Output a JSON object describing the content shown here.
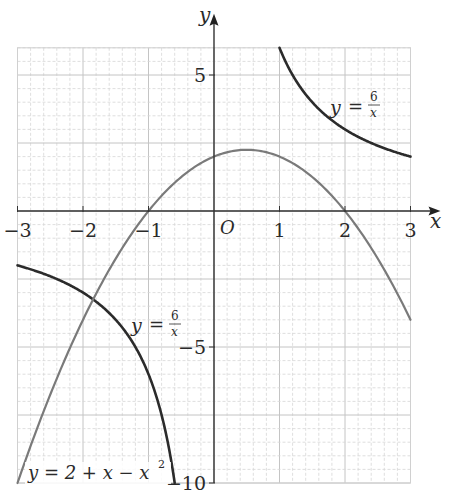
{
  "chart_data": {
    "type": "line",
    "title": "",
    "xlabel": "x",
    "ylabel": "y",
    "origin_label": "O",
    "xlim": [
      -3,
      3
    ],
    "ylim": [
      -10,
      6
    ],
    "x_ticks": [
      -3,
      -2,
      -1,
      1,
      2,
      3
    ],
    "x_tick_labels": [
      "−3",
      "−2",
      "−1",
      "1",
      "2",
      "3"
    ],
    "y_ticks": [
      5,
      -5,
      -10
    ],
    "y_tick_labels": [
      "5",
      "−5",
      "−10"
    ],
    "grid": {
      "on": true,
      "major_x": 1,
      "major_y": 2.5,
      "minor_x": 0.2,
      "minor_y": 0.5
    },
    "series": [
      {
        "name": "y = 6/x (x > 0)",
        "label": "y = 6/x",
        "function": "6/x",
        "domain": [
          1,
          3
        ],
        "color": "#2b2b2b",
        "x": [
          1,
          1.25,
          1.5,
          1.75,
          2,
          2.5,
          3
        ],
        "y": [
          6,
          4.8,
          4,
          3.43,
          3,
          2.4,
          2
        ]
      },
      {
        "name": "y = 6/x (x < 0)",
        "label": "y = 6/x",
        "function": "6/x",
        "domain": [
          -3,
          -0.6
        ],
        "color": "#2b2b2b",
        "x": [
          -3,
          -2.5,
          -2,
          -1.5,
          -1,
          -0.75,
          -0.6
        ],
        "y": [
          -2,
          -2.4,
          -3,
          -4,
          -6,
          -8,
          -10
        ]
      },
      {
        "name": "y = 2 + x − x²",
        "label": "y = 2 + x − x²",
        "function": "2 + x - x^2",
        "domain": [
          -3,
          3
        ],
        "color": "#7a7a7a",
        "x": [
          -3,
          -2,
          -1,
          0,
          0.5,
          1,
          2,
          3
        ],
        "y": [
          -10,
          -4,
          0,
          2,
          2.25,
          2,
          0,
          -4
        ]
      }
    ],
    "annotations": [
      {
        "text": "y = 6/x",
        "near": [
          1.8,
          4.2
        ]
      },
      {
        "text": "y = 6/x",
        "near": [
          -1.0,
          -4.2
        ]
      },
      {
        "text": "y = 2 + x − x²",
        "near": [
          -2.0,
          -9.7
        ]
      }
    ]
  },
  "labels": {
    "x_axis": "x",
    "y_axis": "y",
    "origin": "O",
    "curve_upper": {
      "y": "y",
      "eq": "=",
      "num": "6",
      "den": "x"
    },
    "curve_lower": {
      "y": "y",
      "eq": "=",
      "num": "6",
      "den": "x"
    },
    "parabola": "y = 2 + x − x",
    "parabola_exp": "2"
  }
}
